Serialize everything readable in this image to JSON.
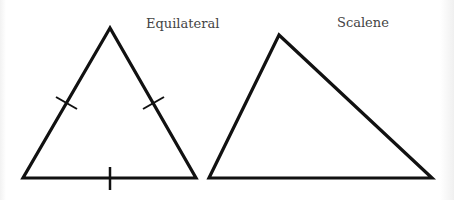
{
  "diagram": {
    "shapes": [
      {
        "label": "Equilateral",
        "points": [
          [
            110,
            28
          ],
          [
            23,
            178
          ],
          [
            196,
            178
          ]
        ],
        "tick_marks": 3
      },
      {
        "label": "Scalene",
        "points": [
          [
            279,
            35
          ],
          [
            209,
            178
          ],
          [
            432,
            178
          ]
        ],
        "tick_marks": 0
      }
    ],
    "colors": {
      "stroke": "#111111",
      "label": "#444444"
    }
  }
}
